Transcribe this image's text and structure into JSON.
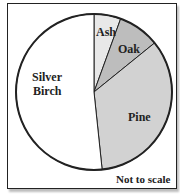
{
  "chart_data": {
    "type": "pie",
    "title": "",
    "slices": [
      {
        "label": "Ash",
        "degrees": 20,
        "color": "#e8e8e8"
      },
      {
        "label": "Oak",
        "degrees": 31,
        "color": "#bdbdbd"
      },
      {
        "label": "Pine",
        "degrees": 123,
        "color": "#d2d2d2"
      },
      {
        "label": "Silver Birch",
        "degrees": 186,
        "color": "#ffffff"
      }
    ],
    "annotation": "Not to scale"
  },
  "labels": {
    "ash": "Ash",
    "oak": "Oak",
    "pine": "Pine",
    "birch_1": "Silver",
    "birch_2": "Birch",
    "note": "Not to scale"
  }
}
